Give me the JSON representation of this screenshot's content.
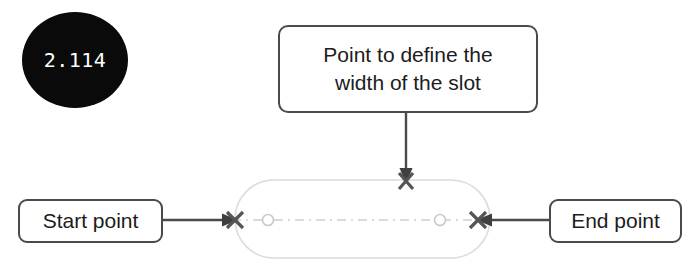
{
  "figure": {
    "step_bullet": {
      "number": "2.114",
      "shape": "filled-ellipse",
      "fill_color": "#0a0a0a",
      "text_color": "#ffffff"
    },
    "callouts": [
      {
        "id": "width-callout",
        "line1": "Point to define the",
        "line2": "width of the slot",
        "leader": "vertical-down-arrow",
        "points_to": "top-width-point"
      },
      {
        "id": "start-callout",
        "label": "Start point",
        "leader": "horizontal-right-arrow",
        "points_to": "left-end-point"
      },
      {
        "id": "end-callout",
        "label": "End point",
        "leader": "horizontal-left-arrow",
        "points_to": "right-end-point"
      }
    ],
    "geometry": {
      "shape_name": "slot",
      "outline_color": "#d8d8d8",
      "centerline_color": "#cccccc",
      "marker_color": "#555555",
      "markers": [
        {
          "id": "left-end-point",
          "type": "x-marker",
          "x": 235,
          "y": 220
        },
        {
          "id": "right-end-point",
          "type": "x-marker",
          "x": 478,
          "y": 220
        },
        {
          "id": "top-width-point",
          "type": "x-marker",
          "x": 406,
          "y": 181
        },
        {
          "id": "left-arc-center",
          "type": "circle-marker",
          "x": 268,
          "y": 220
        },
        {
          "id": "right-arc-center",
          "type": "circle-marker",
          "x": 440,
          "y": 220
        }
      ]
    }
  }
}
